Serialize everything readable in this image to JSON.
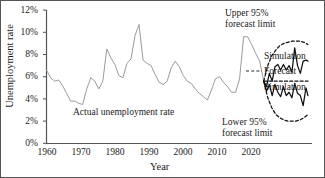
{
  "chart_data": {
    "type": "line",
    "title": "",
    "xlabel": "Year",
    "ylabel": "Unemployment rate",
    "xlim": [
      1960,
      2026
    ],
    "ylim": [
      0,
      12
    ],
    "grid": false,
    "legend_position": "right-inline",
    "x_ticks": [
      "1960",
      "1970",
      "1980",
      "1990",
      "2000",
      "2010",
      "2020"
    ],
    "x_tick_values": [
      1960,
      1970,
      1980,
      1990,
      2000,
      2010,
      2020
    ],
    "y_ticks": [
      "0%",
      "2%",
      "4%",
      "6%",
      "8%",
      "10%",
      "12%"
    ],
    "y_tick_values": [
      0,
      2,
      4,
      6,
      8,
      10,
      12
    ],
    "annotations": [
      {
        "text": "Upper 95%\nforecast limit",
        "x": 2018,
        "y": 11.4
      },
      {
        "text": "Lower 95%\nforecast limit",
        "x": 2017,
        "y": 1.5
      },
      {
        "text": "Actual unemployment rate",
        "x": 1985,
        "y": 2.6
      }
    ],
    "series": [
      {
        "name": "Actual unemployment rate",
        "style": "solid",
        "color": "#9a9a9a",
        "x": [
          1960,
          1961,
          1962,
          1963,
          1964,
          1965,
          1966,
          1967,
          1968,
          1969,
          1970,
          1971,
          1972,
          1973,
          1974,
          1975,
          1976,
          1977,
          1978,
          1979,
          1980,
          1981,
          1982,
          1983,
          1984,
          1985,
          1986,
          1987,
          1988,
          1989,
          1990,
          1991,
          1992,
          1993,
          1994,
          1995,
          1996,
          1997,
          1998,
          1999,
          2000,
          2001,
          2002,
          2003,
          2004,
          2005,
          2006,
          2007,
          2008,
          2009,
          2010,
          2011,
          2012,
          2013,
          2014
        ],
        "values": [
          6.6,
          5.9,
          5.6,
          5.7,
          5.2,
          4.5,
          3.8,
          3.8,
          3.6,
          3.5,
          4.9,
          5.9,
          5.6,
          4.9,
          5.6,
          8.5,
          7.7,
          7.1,
          6.1,
          5.9,
          7.2,
          7.6,
          9.7,
          10.7,
          7.5,
          7.2,
          7.0,
          6.2,
          5.5,
          5.3,
          5.6,
          6.8,
          7.4,
          6.9,
          6.1,
          5.6,
          5.4,
          4.9,
          4.5,
          4.2,
          3.9,
          4.8,
          5.8,
          6.0,
          5.5,
          5.1,
          4.6,
          4.6,
          5.8,
          9.6,
          9.6,
          8.9,
          8.1,
          7.4,
          5.6
        ]
      },
      {
        "name": "Forecast",
        "style": "dashed",
        "color": "#111111",
        "x": [
          2014,
          2015,
          2016,
          2017,
          2018,
          2019,
          2020,
          2021,
          2022,
          2023,
          2024,
          2025
        ],
        "values": [
          5.6,
          5.6,
          5.6,
          5.6,
          5.6,
          5.6,
          5.6,
          5.6,
          5.6,
          5.6,
          5.6,
          5.6
        ]
      },
      {
        "name": "Upper 95% forecast limit",
        "style": "dashed",
        "color": "#111111",
        "x": [
          2014,
          2015,
          2016,
          2017,
          2018,
          2019,
          2020,
          2021,
          2022,
          2023,
          2024,
          2025
        ],
        "values": [
          5.6,
          7.0,
          7.9,
          8.4,
          8.8,
          9.0,
          9.1,
          9.2,
          9.2,
          9.2,
          9.1,
          8.9
        ]
      },
      {
        "name": "Lower 95% forecast limit",
        "style": "dashed",
        "color": "#111111",
        "x": [
          2014,
          2015,
          2016,
          2017,
          2018,
          2019,
          2020,
          2021,
          2022,
          2023,
          2024,
          2025
        ],
        "values": [
          5.6,
          4.1,
          3.2,
          2.6,
          2.3,
          2.1,
          2.0,
          2.0,
          2.0,
          2.1,
          2.3,
          2.6
        ]
      },
      {
        "name": "Simulation upper",
        "style": "solid",
        "color": "#111111",
        "x": [
          2014,
          2014.7,
          2015.4,
          2016.1,
          2016.8,
          2017.5,
          2018.2,
          2018.9,
          2019.6,
          2020.3,
          2021.0,
          2021.7,
          2022.4,
          2023.1,
          2023.8,
          2024.5,
          2025.0
        ],
        "values": [
          5.6,
          5.1,
          6.3,
          5.6,
          6.9,
          7.1,
          6.6,
          7.1,
          6.6,
          7.0,
          6.4,
          8.6,
          7.0,
          6.3,
          7.4,
          7.5,
          7.4
        ]
      },
      {
        "name": "Simulation lower",
        "style": "solid",
        "color": "#111111",
        "x": [
          2014,
          2014.7,
          2015.4,
          2016.1,
          2016.8,
          2017.5,
          2018.2,
          2018.9,
          2019.6,
          2020.3,
          2021.0,
          2021.7,
          2022.4,
          2023.1,
          2023.8,
          2024.5,
          2025.0
        ],
        "values": [
          5.6,
          4.7,
          5.3,
          4.3,
          5.3,
          4.6,
          4.2,
          5.1,
          4.3,
          4.6,
          4.1,
          5.4,
          4.5,
          4.3,
          3.4,
          5.0,
          4.3
        ]
      }
    ]
  },
  "axes": {
    "y_title": "Unemployment rate",
    "x_title": "Year",
    "y_ticks": [
      "12%",
      "10%",
      "8%",
      "6%",
      "4%",
      "2%",
      "0%"
    ],
    "x_ticks": [
      "1960",
      "1970",
      "1980",
      "1990",
      "2000",
      "2010",
      "2020"
    ]
  },
  "annotations": {
    "upper_limit_line1": "Upper 95%",
    "upper_limit_line2": "forecast limit",
    "lower_limit_line1": "Lower 95%",
    "lower_limit_line2": "forecast limit",
    "actual_label": "Actual unemployment rate"
  },
  "legend": {
    "simulation_top": "Simulation",
    "forecast": "Forecast",
    "simulation_bottom": "Simulation"
  },
  "colors": {
    "history_line": "#9a9a9a",
    "forecast_line": "#111111",
    "simulation_line": "#111111",
    "axis": "#555555",
    "text": "#1a1a1a",
    "border": "#555555"
  }
}
